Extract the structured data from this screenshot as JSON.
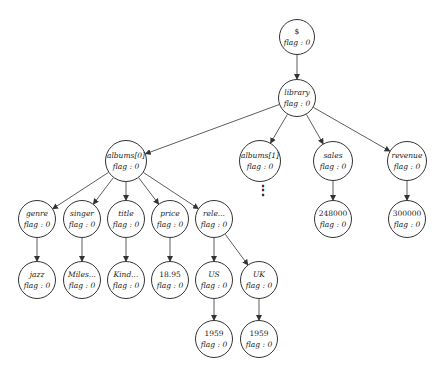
{
  "diagram": {
    "nodes": [
      {
        "id": "root",
        "label": "$",
        "flag": "flag : 0",
        "x": 297,
        "y": 37,
        "r": 18,
        "numeric": true
      },
      {
        "id": "library",
        "label": "library",
        "flag": "flag : 0",
        "x": 297,
        "y": 98,
        "r": 19
      },
      {
        "id": "albums0",
        "label": "albums[0]",
        "flag": "flag : 0",
        "x": 126,
        "y": 161,
        "r": 21
      },
      {
        "id": "albums1",
        "label": "albums[1]",
        "flag": "flag : 0",
        "x": 260,
        "y": 161,
        "r": 21
      },
      {
        "id": "sales",
        "label": "sales",
        "flag": "flag : 0",
        "x": 333,
        "y": 161,
        "r": 20
      },
      {
        "id": "revenue",
        "label": "revenue",
        "flag": "flag : 0",
        "x": 407,
        "y": 161,
        "r": 20
      },
      {
        "id": "genre",
        "label": "genre",
        "flag": "flag : 0",
        "x": 37,
        "y": 219,
        "r": 19
      },
      {
        "id": "singer",
        "label": "singer",
        "flag": "flag : 0",
        "x": 82,
        "y": 219,
        "r": 19
      },
      {
        "id": "title",
        "label": "title",
        "flag": "flag : 0",
        "x": 126,
        "y": 219,
        "r": 19
      },
      {
        "id": "price",
        "label": "price",
        "flag": "flag : 0",
        "x": 170,
        "y": 219,
        "r": 19
      },
      {
        "id": "release",
        "label": "rele...",
        "flag": "flag : 0",
        "x": 214,
        "y": 219,
        "r": 19
      },
      {
        "id": "sales_val",
        "label": "248000",
        "flag": "flag : 0",
        "x": 333,
        "y": 219,
        "r": 19,
        "numeric": true
      },
      {
        "id": "revenue_val",
        "label": "300000",
        "flag": "flag : 0",
        "x": 407,
        "y": 219,
        "r": 19,
        "numeric": true
      },
      {
        "id": "genre_val",
        "label": "jazz",
        "flag": "flag : 0",
        "x": 37,
        "y": 280,
        "r": 19
      },
      {
        "id": "singer_val",
        "label": "Miles...",
        "flag": "flag : 0",
        "x": 82,
        "y": 280,
        "r": 19
      },
      {
        "id": "title_val",
        "label": "Kind...",
        "flag": "flag : 0",
        "x": 126,
        "y": 280,
        "r": 19
      },
      {
        "id": "price_val",
        "label": "18.95",
        "flag": "flag : 0",
        "x": 170,
        "y": 280,
        "r": 19,
        "numeric": true
      },
      {
        "id": "us",
        "label": "US",
        "flag": "flag : 0",
        "x": 214,
        "y": 280,
        "r": 19
      },
      {
        "id": "uk",
        "label": "UK",
        "flag": "flag : 0",
        "x": 259,
        "y": 280,
        "r": 19
      },
      {
        "id": "us_val",
        "label": "1959",
        "flag": "flag : 0",
        "x": 214,
        "y": 339,
        "r": 19,
        "numeric": true
      },
      {
        "id": "uk_val",
        "label": "1959",
        "flag": "flag : 0",
        "x": 259,
        "y": 339,
        "r": 19,
        "numeric": true
      }
    ],
    "edges": [
      [
        "root",
        "library"
      ],
      [
        "library",
        "albums0"
      ],
      [
        "library",
        "albums1"
      ],
      [
        "library",
        "sales"
      ],
      [
        "library",
        "revenue"
      ],
      [
        "albums0",
        "genre"
      ],
      [
        "albums0",
        "singer"
      ],
      [
        "albums0",
        "title"
      ],
      [
        "albums0",
        "price"
      ],
      [
        "albums0",
        "release"
      ],
      [
        "sales",
        "sales_val"
      ],
      [
        "revenue",
        "revenue_val"
      ],
      [
        "genre",
        "genre_val"
      ],
      [
        "singer",
        "singer_val"
      ],
      [
        "title",
        "title_val"
      ],
      [
        "price",
        "price_val"
      ],
      [
        "release",
        "us"
      ],
      [
        "release",
        "uk"
      ],
      [
        "us",
        "us_val"
      ],
      [
        "uk",
        "uk_val"
      ]
    ],
    "ellipsis": {
      "symbol": "⋮",
      "x": 259,
      "y": 188
    }
  }
}
